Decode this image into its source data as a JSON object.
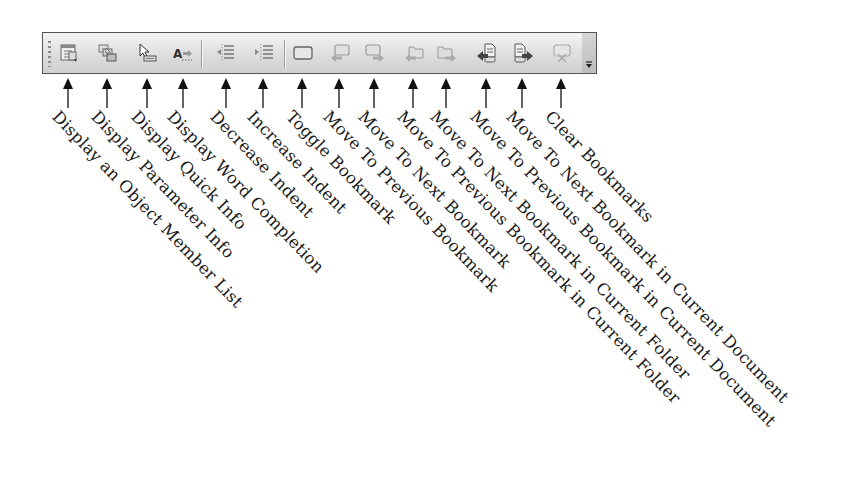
{
  "toolbar": {
    "buttons": [
      {
        "id": "member-list",
        "icon": "member-list-icon",
        "x": 68,
        "label": "Display an Object Member List"
      },
      {
        "id": "parameter-info",
        "icon": "parameter-info-icon",
        "x": 107,
        "label": "Display Parameter Info"
      },
      {
        "id": "quick-info",
        "icon": "quick-info-icon",
        "x": 147,
        "label": "Display Quick Info"
      },
      {
        "id": "word-completion",
        "icon": "word-completion-icon",
        "x": 183,
        "label": "Display Word Completion"
      },
      {
        "id": "decrease-indent",
        "icon": "decrease-indent-icon",
        "x": 226,
        "label": "Decrease Indent"
      },
      {
        "id": "increase-indent",
        "icon": "increase-indent-icon",
        "x": 263,
        "label": "Increase Indent"
      },
      {
        "id": "toggle-bookmark",
        "icon": "bookmark-icon",
        "x": 302,
        "label": "Toggle Bookmark"
      },
      {
        "id": "prev-bookmark",
        "icon": "previous-bookmark-icon",
        "x": 339,
        "label": "Move To Previous Bookmark"
      },
      {
        "id": "next-bookmark",
        "icon": "next-bookmark-icon",
        "x": 374,
        "label": "Move To Next Bookmark"
      },
      {
        "id": "prev-bookmark-folder",
        "icon": "previous-bookmark-folder-icon",
        "x": 413,
        "label": "Move To Previous Bookmark in Current Folder"
      },
      {
        "id": "next-bookmark-folder",
        "icon": "next-bookmark-folder-icon",
        "x": 446,
        "label": "Move To Next Bookmark in Current Folder"
      },
      {
        "id": "prev-bookmark-document",
        "icon": "previous-bookmark-document-icon",
        "x": 486,
        "label": "Move To Previous Bookmark in Current Document"
      },
      {
        "id": "next-bookmark-document",
        "icon": "next-bookmark-document-icon",
        "x": 522,
        "label": "Move To Next Bookmark in Current Document"
      },
      {
        "id": "clear-bookmarks",
        "icon": "clear-bookmarks-icon",
        "x": 561,
        "label": "Clear Bookmarks"
      }
    ],
    "separators_x": [
      201,
      284
    ],
    "overflow": {
      "icon": "toolbar-overflow-icon"
    }
  },
  "labels": [
    "Display an Object Member List",
    "Display Parameter Info",
    "Display Quick Info",
    "Display Word Completion",
    "Decrease Indent",
    "Increase Indent",
    "Toggle Bookmark",
    "Move To Previous Bookmark",
    "Move To Next Bookmark",
    "Move To Previous Bookmark in Current Folder",
    "Move To Next Bookmark in Current Folder",
    "Move To Previous Bookmark in Current Document",
    "Move To Next Bookmark in Current Document",
    "Clear Bookmarks"
  ],
  "colors": {
    "toolbar_border": "#555555",
    "icon_gray": "#7a7a7a",
    "text": "#1a1a1a"
  }
}
